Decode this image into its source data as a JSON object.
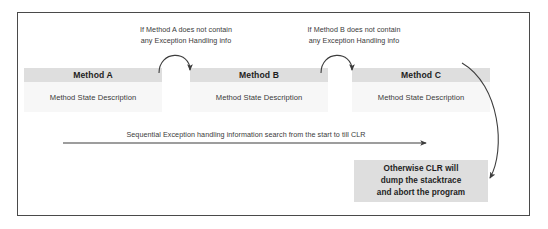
{
  "diagram": {
    "frame_border_color": "#4a4a4a",
    "header_fill": "#dedede",
    "body_fill": "#f7f7f7",
    "text_color": "#3a3a3a",
    "arrow_color": "#3d3d3d",
    "conditions": [
      {
        "id": "cond-a",
        "text": "If Method A does not contain\nany Exception Handling info"
      },
      {
        "id": "cond-b",
        "text": "If Method B does not contain\nany Exception Handling info"
      }
    ],
    "methods": [
      {
        "id": "a",
        "header": "Method A",
        "body": "Method State Description"
      },
      {
        "id": "b",
        "header": "Method B",
        "body": "Method State Description"
      },
      {
        "id": "c",
        "header": "Method C",
        "body": "Method State Description"
      }
    ],
    "sequential_label": "Sequential Exception handling information search from the start to till CLR",
    "outcome_box": {
      "line1": "Otherwise CLR will",
      "line2": "dump the stacktrace",
      "line3": "and abort the program"
    }
  }
}
